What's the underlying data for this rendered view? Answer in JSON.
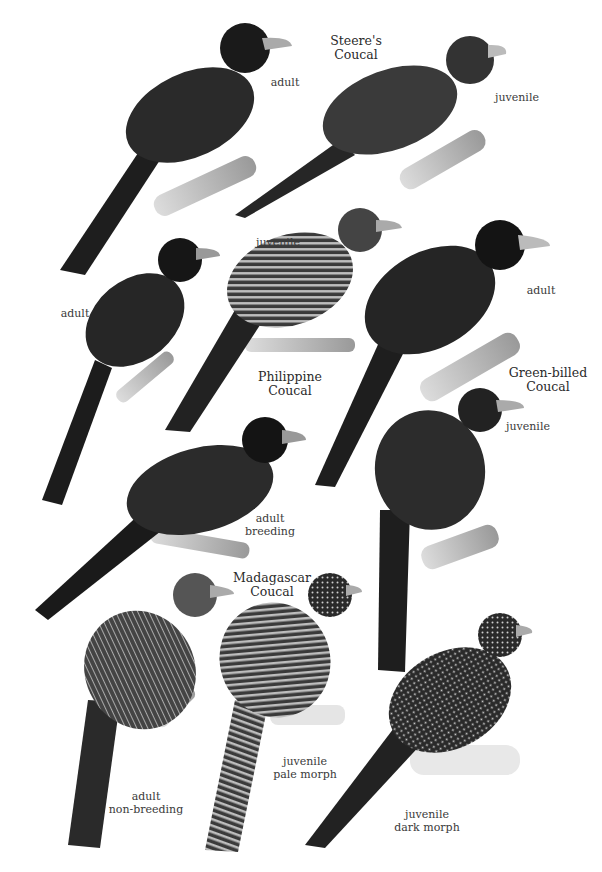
{
  "plate": {
    "species": [
      {
        "name": "Steere's Coucal",
        "line1": "Steere's",
        "line2": "Coucal",
        "labels": [
          "adult",
          "juvenile"
        ]
      },
      {
        "name": "Philippine Coucal",
        "line1": "Philippine",
        "line2": "Coucal",
        "labels": [
          "adult",
          "juvenile"
        ]
      },
      {
        "name": "Green-billed Coucal",
        "line1": "Green-billed",
        "line2": "Coucal",
        "labels": [
          "adult",
          "juvenile"
        ]
      },
      {
        "name": "Madagascar Coucal",
        "line1": "Madagascar",
        "line2": "Coucal",
        "labels": [
          "adult breeding",
          "adult non-breeding",
          "juvenile pale morph",
          "juvenile dark morph"
        ]
      }
    ],
    "labels": {
      "steere_adult": "adult",
      "steere_juv": "juvenile",
      "phil_adult": "adult",
      "phil_juv": "juvenile",
      "green_adult": "adult",
      "green_juv": "juvenile",
      "mad_breed_1": "adult",
      "mad_breed_2": "breeding",
      "mad_nonbreed_1": "adult",
      "mad_nonbreed_2": "non-breeding",
      "mad_pale_1": "juvenile",
      "mad_pale_2": "pale morph",
      "mad_dark_1": "juvenile",
      "mad_dark_2": "dark morph"
    }
  }
}
